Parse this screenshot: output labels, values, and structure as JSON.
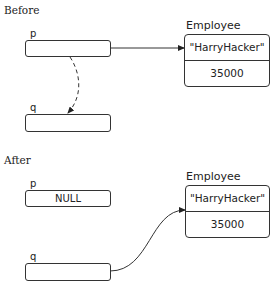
{
  "before": {
    "heading": "Before",
    "p": {
      "label": "p",
      "value": ""
    },
    "q": {
      "label": "q",
      "value": ""
    },
    "object": {
      "type_label": "Employee",
      "name": "\"HarryHacker\"",
      "salary": "35000"
    }
  },
  "after": {
    "heading": "After",
    "p": {
      "label": "p",
      "value": "NULL"
    },
    "q": {
      "label": "q",
      "value": ""
    },
    "object": {
      "type_label": "Employee",
      "name": "\"HarryHacker\"",
      "salary": "35000"
    }
  }
}
